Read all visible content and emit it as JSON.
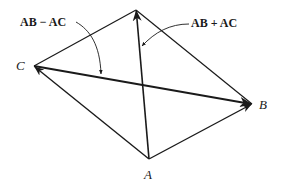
{
  "diagram": {
    "type": "vector-parallelogram",
    "colors": {
      "ink": "#1a1a1a",
      "background": "#ffffff"
    },
    "vertices": {
      "A": {
        "label": "A",
        "x": 149,
        "y": 159
      },
      "B": {
        "label": "B",
        "x": 252,
        "y": 104
      },
      "C": {
        "label": "C",
        "x": 34,
        "y": 66
      },
      "D": {
        "label": "",
        "x": 136,
        "y": 10
      }
    },
    "vectors": [
      {
        "name": "AB",
        "from": "A",
        "to": "B",
        "arrow": true
      },
      {
        "name": "AC",
        "from": "A",
        "to": "C",
        "arrow": true
      },
      {
        "name": "AB + AC",
        "from": "A",
        "to": "D",
        "arrow": true
      },
      {
        "name": "AB - AC",
        "from": "C",
        "to": "B",
        "arrow": true
      }
    ],
    "edges": [
      {
        "from": "C",
        "to": "D"
      },
      {
        "from": "D",
        "to": "B"
      }
    ],
    "annotations": {
      "difference": {
        "text": "AB − AC"
      },
      "sum": {
        "text": "AB + AC"
      }
    }
  }
}
